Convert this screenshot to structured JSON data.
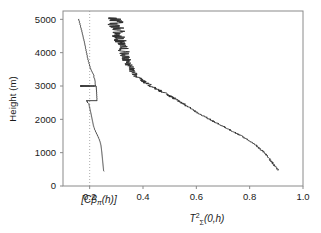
{
  "figure": {
    "kind": "lidar-profile-figure",
    "background": "#ffffff",
    "frame_color": "#808080",
    "curve_color": "#2b2b2b",
    "gridline_color": "#9a9a9a"
  },
  "chart_data": {
    "type": "line",
    "title": "",
    "subtitle": "",
    "orientation": "vertical-profile",
    "xlabel": "T²ᵩ(0,h)",
    "xlabel_parts": {
      "base": "T",
      "superscript": "2",
      "subscript": "Σ",
      "argument": "(0,h)"
    },
    "ylabel": "Height (m)",
    "xlim": [
      0.1,
      1.0
    ],
    "ylim": [
      0,
      5250
    ],
    "grid": false,
    "legend": "none",
    "xticks": [
      0.2,
      0.4,
      0.6,
      0.8,
      1.0
    ],
    "xticklabels": [
      "0.2",
      "0.4",
      "0.6",
      "0.8",
      "1.0"
    ],
    "yticks": [
      0,
      1000,
      2000,
      3000,
      4000,
      5000
    ],
    "yticklabels": [
      "0",
      "1000",
      "2000",
      "3000",
      "4000",
      "5000"
    ],
    "annotations": [
      {
        "name": "backscatter-axis-label",
        "text": "[Cβπ(h)]",
        "x": 0.145,
        "y": -320
      }
    ],
    "reference_lines": [
      {
        "name": "vertical-dotted-line",
        "orientation": "vertical",
        "value": 0.2,
        "style": "dotted"
      }
    ],
    "series": [
      {
        "name": "backscatter-profile",
        "label": "[Cβπ(h)]",
        "units": "arbitrary",
        "note": "left curve, plotted on an independent arbitrary horizontal scale",
        "x": [
          0.159,
          0.1585,
          0.16,
          0.161,
          0.1625,
          0.1615,
          0.163,
          0.164,
          0.1635,
          0.165,
          0.166,
          0.1655,
          0.167,
          0.1665,
          0.168,
          0.169,
          0.1685,
          0.17,
          0.171,
          0.1705,
          0.172,
          0.1715,
          0.1725,
          0.1735,
          0.173,
          0.1745,
          0.1755,
          0.175,
          0.176,
          0.177,
          0.1765,
          0.178,
          0.1775,
          0.179,
          0.18,
          0.1795,
          0.1805,
          0.1815,
          0.181,
          0.182,
          0.183,
          0.1825,
          0.184,
          0.1835,
          0.185,
          0.1845,
          0.1855,
          0.1865,
          0.186,
          0.187,
          0.188,
          0.1875,
          0.1885,
          0.1895,
          0.189,
          0.19,
          0.191,
          0.1905,
          0.192,
          0.1915,
          0.1925,
          0.1935,
          0.193,
          0.1945,
          0.1955,
          0.195,
          0.1965,
          0.1975,
          0.197,
          0.1985,
          0.1995,
          0.199,
          0.2005,
          0.2015,
          0.201,
          0.2025,
          0.2035,
          0.204,
          0.2055,
          0.2065,
          0.2075,
          0.209,
          0.21,
          0.2115,
          0.2125,
          0.214,
          0.215,
          0.216,
          0.215,
          0.217,
          0.216,
          0.218,
          0.2175,
          0.219,
          0.22,
          0.2195,
          0.2205,
          0.22,
          0.221,
          0.2205,
          0.2215,
          0.221,
          0.222,
          0.2215,
          0.165,
          0.1655,
          0.1648,
          0.166,
          0.1652,
          0.1665,
          0.1658,
          0.167,
          0.1662,
          0.1675,
          0.1668,
          0.168,
          0.1672,
          0.1685,
          0.1678,
          0.169,
          0.1683,
          0.1695,
          0.1688,
          0.17,
          0.1693,
          0.1705,
          0.1698,
          0.171,
          0.1703,
          0.1715,
          0.1708,
          0.1722,
          0.1714,
          0.1728,
          0.172,
          0.1735,
          0.1727,
          0.1742,
          0.1734,
          0.175,
          0.1742,
          0.1758,
          0.175,
          0.1765,
          0.1757,
          0.1772,
          0.1764,
          0.178,
          0.1772,
          0.1788,
          0.178,
          0.1795,
          0.1788,
          0.1802,
          0.1795,
          0.181,
          0.1803,
          0.1818,
          0.181,
          0.1826,
          0.1818,
          0.1834,
          0.1826,
          0.1842,
          0.1834,
          0.185,
          0.1842,
          0.1858,
          0.185,
          0.1866,
          0.1858,
          0.1874,
          0.1866,
          0.1882,
          0.1875,
          0.189,
          0.1883,
          0.1898,
          0.189,
          0.1905,
          0.1898,
          0.1913,
          0.1906,
          0.1921,
          0.1914,
          0.193,
          0.1922,
          0.1938,
          0.193,
          0.1946,
          0.1938,
          0.1954,
          0.1946,
          0.1962,
          0.1954,
          0.197,
          0.1962,
          0.1978,
          0.197,
          0.1986,
          0.1978,
          0.1995,
          0.1988,
          0.2005,
          0.2,
          0.2018,
          0.2012,
          0.203,
          0.2025,
          0.2042,
          0.2038,
          0.2055,
          0.205,
          0.2068,
          0.2062,
          0.208,
          0.2075,
          0.2092,
          0.2088,
          0.2105,
          0.21,
          0.2118,
          0.2112,
          0.213,
          0.2125,
          0.214,
          0.2135,
          0.215,
          0.2145,
          0.2158,
          0.2155,
          0.2165,
          0.2162,
          0.217,
          0.2168,
          0.2175,
          0.2172,
          0.2178,
          0.224,
          0.225,
          0.2245,
          0.2255,
          0.225,
          0.226,
          0.2255,
          0.2265,
          0.2258,
          0.2268,
          0.2262,
          0.2272,
          0.2266,
          0.2275,
          0.227,
          0.2278,
          0.188,
          0.1895,
          0.1885,
          0.19,
          0.1892,
          0.1905,
          0.1898,
          0.1912,
          0.1904,
          0.1918,
          0.191,
          0.1925,
          0.1916,
          0.193,
          0.1922,
          0.1936,
          0.196,
          0.1975,
          0.1968,
          0.1982,
          0.1975,
          0.199,
          0.1983,
          0.1998,
          0.199,
          0.2005,
          0.1998,
          0.2012,
          0.2005,
          0.202,
          0.2013,
          0.2028,
          0.202,
          0.2035,
          0.2028,
          0.2042,
          0.2035,
          0.205,
          0.2043,
          0.2058,
          0.205,
          0.2065,
          0.2058,
          0.2072,
          0.2066,
          0.208,
          0.2074,
          0.2088,
          0.2082,
          0.2096,
          0.209,
          0.2104,
          0.2098,
          0.2112,
          0.2106,
          0.212,
          0.2114,
          0.2128,
          0.2122,
          0.2136,
          0.213,
          0.2145,
          0.2138,
          0.2155,
          0.2148,
          0.2165,
          0.2158,
          0.2178,
          0.2172,
          0.2192,
          0.2186,
          0.2208,
          0.2202,
          0.2225,
          0.2218,
          0.2242,
          0.2236,
          0.226,
          0.2254,
          0.2278,
          0.2272,
          0.2296,
          0.229,
          0.2312,
          0.2306,
          0.2328,
          0.2322,
          0.2344,
          0.2338,
          0.2358,
          0.2352,
          0.2372,
          0.2366,
          0.2385,
          0.238,
          0.2396,
          0.239,
          0.2405,
          0.24,
          0.2414,
          0.2408,
          0.242,
          0.2416,
          0.2428,
          0.2422,
          0.2432,
          0.2428,
          0.2436,
          0.2432,
          0.244,
          0.2436,
          0.2444,
          0.244,
          0.2448,
          0.2444,
          0.2452,
          0.2448,
          0.2456,
          0.2452,
          0.246,
          0.2455,
          0.2464,
          0.2458,
          0.2468,
          0.2462,
          0.2472,
          0.2466,
          0.2476,
          0.247,
          0.248,
          0.2474,
          0.2484,
          0.2478,
          0.2488,
          0.2482,
          0.2492,
          0.2486,
          0.2496,
          0.249,
          0.25,
          0.2494,
          0.2504,
          0.2498,
          0.2508,
          0.2502,
          0.2512,
          0.2506,
          0.2516,
          0.251,
          0.252,
          0.2514,
          0.2524,
          0.2518,
          0.2528,
          0.2522,
          0.2532
        ]
      },
      {
        "name": "transmittance-squared-profile",
        "label": "T²ᵩ(0,h)",
        "units": "dimensionless",
        "note": "right curve, noisy, monotonically decreasing with height",
        "values_at_heights": [
          {
            "height": 500,
            "value": 0.905
          },
          {
            "height": 750,
            "value": 0.88
          },
          {
            "height": 1000,
            "value": 0.855
          },
          {
            "height": 1250,
            "value": 0.82
          },
          {
            "height": 1500,
            "value": 0.77
          },
          {
            "height": 1750,
            "value": 0.71
          },
          {
            "height": 2000,
            "value": 0.65
          },
          {
            "height": 2250,
            "value": 0.595
          },
          {
            "height": 2500,
            "value": 0.545
          },
          {
            "height": 2750,
            "value": 0.49
          },
          {
            "height": 3000,
            "value": 0.43
          },
          {
            "height": 3250,
            "value": 0.38
          },
          {
            "height": 3500,
            "value": 0.355
          },
          {
            "height": 3750,
            "value": 0.34
          },
          {
            "height": 4000,
            "value": 0.33
          },
          {
            "height": 4250,
            "value": 0.32
          },
          {
            "height": 4500,
            "value": 0.31
          },
          {
            "height": 4750,
            "value": 0.3
          },
          {
            "height": 5000,
            "value": 0.295
          }
        ]
      }
    ]
  }
}
